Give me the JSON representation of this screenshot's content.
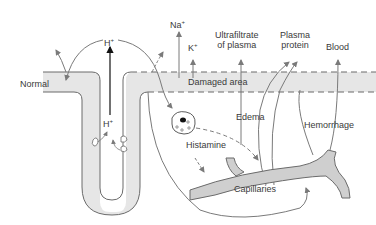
{
  "diagram": {
    "labels": {
      "normal": "Normal",
      "h_top": "H",
      "h_top_sup": "+",
      "h_inner": "H",
      "h_inner_sup": "+",
      "na": "Na",
      "na_sup": "+",
      "k": "K",
      "k_sup": "+",
      "ultrafiltrate_line1": "Ultrafiltrate",
      "ultrafiltrate_line2": "of plasma",
      "plasma_line1": "Plasma",
      "plasma_line2": "protein",
      "blood": "Blood",
      "damaged_area": "Damaged area",
      "edema": "Edema",
      "hemorrhage": "Hemorrhage",
      "histamine": "Histamine",
      "capillaries": "Capillaries"
    },
    "colors": {
      "tissue_fill": "#e6e6e6",
      "outline": "#6b6b6b",
      "arrow": "#7a7a7a",
      "text": "#3a3a3a",
      "cell_nucleus": "#111111"
    }
  }
}
